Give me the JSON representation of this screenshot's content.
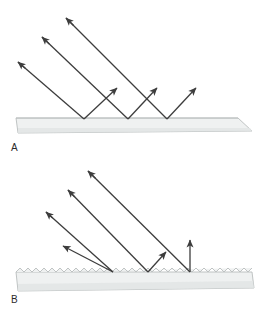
{
  "figure": {
    "background_color": "#ffffff",
    "width": 269,
    "height": 315,
    "ray_color": "#3d3d3d",
    "ray_width": 1.3,
    "slab_fill": "#eff1f1",
    "slab_fill_dark": "#e2e5e5",
    "slab_stroke": "#b9bdbd",
    "slab_stroke_width": 0.9
  },
  "panels": [
    {
      "id": "a",
      "label": "A",
      "label_x": 11,
      "label_y": 142,
      "surface_type": "smooth",
      "caption_semantic": "specular-reflection-smooth-surface",
      "slab": {
        "path": "M 16 118 L 238 118 L 252 131 L 18 133 Z",
        "top_y": 118,
        "left_x": 16,
        "right_x": 252
      },
      "incident_rays": [
        {
          "x1": 18,
          "y1": 62,
          "x2": 84,
          "y2": 119,
          "arrow_at": "start",
          "arrow_t": 0.11
        },
        {
          "x1": 42,
          "y1": 37,
          "x2": 128,
          "y2": 119,
          "arrow_at": "start",
          "arrow_t": 0.085
        },
        {
          "x1": 66,
          "y1": 18,
          "x2": 167,
          "y2": 119,
          "arrow_at": "start",
          "arrow_t": 0.075
        }
      ],
      "reflected_rays": [
        {
          "x1": 84,
          "y1": 119,
          "x2": 117,
          "y2": 88,
          "arrow_at": "end"
        },
        {
          "x1": 128,
          "y1": 119,
          "x2": 157,
          "y2": 88,
          "arrow_at": "end"
        },
        {
          "x1": 167,
          "y1": 119,
          "x2": 196,
          "y2": 88,
          "arrow_at": "end"
        }
      ]
    },
    {
      "id": "b",
      "label": "B",
      "label_x": 11,
      "label_y": 294,
      "surface_type": "rough",
      "caption_semantic": "diffuse-reflection-rough-surface",
      "slab": {
        "path": "M 16 272 L 252 272 L 254 288 L 18 291 Z",
        "top_y": 272,
        "left_x": 16,
        "right_x": 252,
        "sawtooth_period": 8,
        "sawtooth_amplitude": 4
      },
      "incident_rays": [
        {
          "x1": 46,
          "y1": 212,
          "x2": 113,
          "y2": 272,
          "arrow_at": "start",
          "arrow_t": 0.1
        },
        {
          "x1": 68,
          "y1": 190,
          "x2": 148,
          "y2": 272,
          "arrow_at": "start",
          "arrow_t": 0.085
        },
        {
          "x1": 88,
          "y1": 171,
          "x2": 190,
          "y2": 272,
          "arrow_at": "start",
          "arrow_t": 0.075
        }
      ],
      "reflected_rays": [
        {
          "x1": 113,
          "y1": 272,
          "x2": 63,
          "y2": 246,
          "arrow_at": "end"
        },
        {
          "x1": 148,
          "y1": 272,
          "x2": 166,
          "y2": 252,
          "arrow_at": "end"
        },
        {
          "x1": 190,
          "y1": 272,
          "x2": 190,
          "y2": 240,
          "arrow_at": "end"
        }
      ]
    }
  ]
}
